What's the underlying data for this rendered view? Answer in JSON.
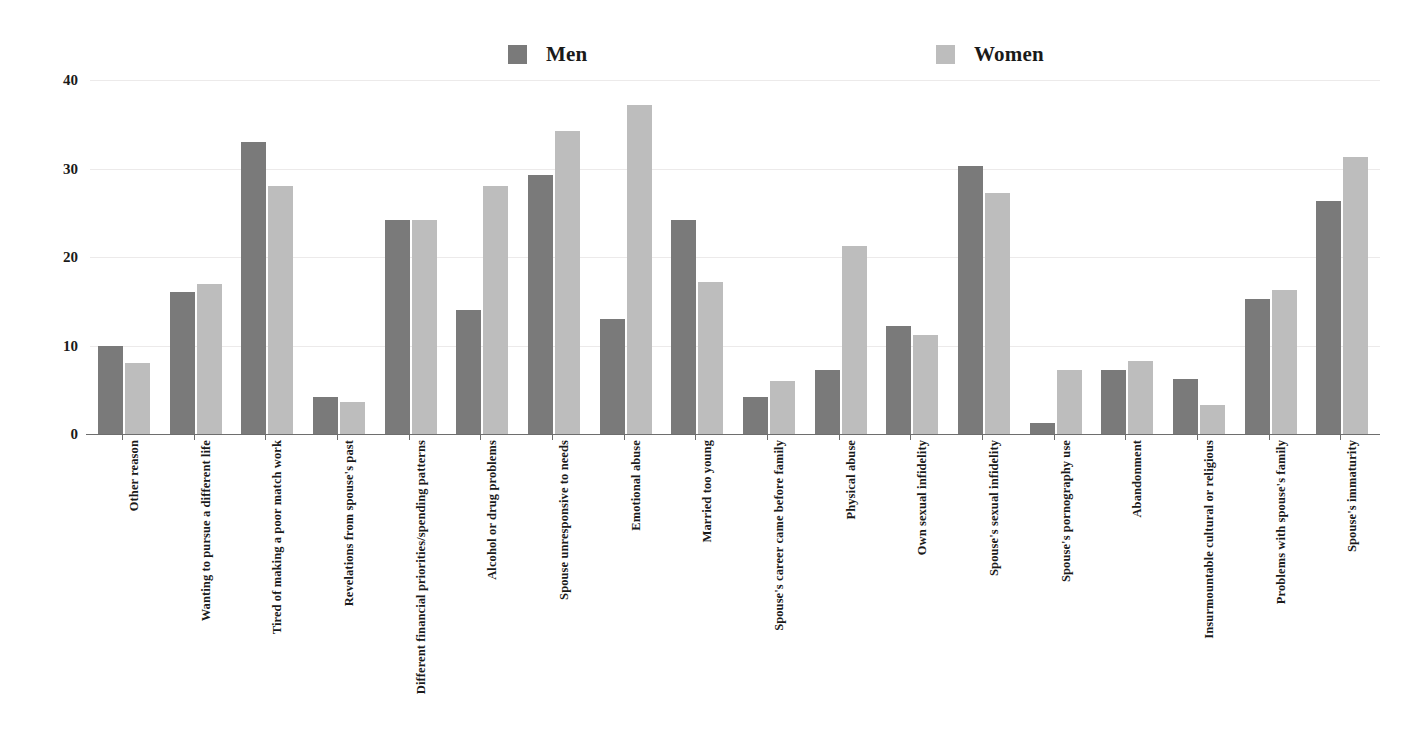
{
  "chart_data": {
    "type": "bar",
    "title": "",
    "xlabel": "",
    "ylabel": "",
    "ylim": [
      0,
      40
    ],
    "yticks": [
      0,
      10,
      20,
      30,
      40
    ],
    "grid": true,
    "legend_position": "top",
    "categories": [
      "Other reason",
      "Wanting to pursue a different life",
      "Tired of making a poor match work",
      "Revelations from spouse's past",
      "Different financial priorities/spending patterns",
      "Alcohol or drug problems",
      "Spouse unresponsive to needs",
      "Emotional abuse",
      "Married too young",
      "Spouse's career came before family",
      "Physical abuse",
      "Own sexual infidelity",
      "Spouse's sexual infidelity",
      "Spouse's pornography use",
      "Abandonment",
      "Insurmountable cultural or religious",
      "Problems with spouse's family",
      "Spouse's immaturity"
    ],
    "series": [
      {
        "name": "Men",
        "color": "#7a7a7a",
        "values": [
          10,
          16,
          33,
          4.2,
          24.2,
          14,
          29.3,
          13,
          24.2,
          4.2,
          7.2,
          12.2,
          30.3,
          1.2,
          7.2,
          6.2,
          15.3,
          26.3
        ]
      },
      {
        "name": "Women",
        "color": "#bdbdbd",
        "values": [
          8,
          17,
          28,
          3.6,
          24.2,
          28,
          34.2,
          37.2,
          17.2,
          6,
          21.3,
          11.2,
          27.2,
          7.2,
          8.2,
          3.3,
          16.3,
          31.3
        ]
      }
    ]
  },
  "legend": {
    "men_label": "Men",
    "women_label": "Women"
  },
  "axis": {
    "y_tick_labels": [
      "0",
      "10",
      "20",
      "30",
      "40"
    ]
  }
}
